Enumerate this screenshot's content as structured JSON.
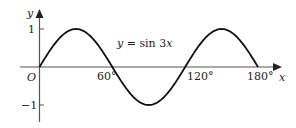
{
  "chart_data": {
    "type": "line",
    "title": "",
    "curve_label": "y = sin 3x",
    "function": "sin(3x)",
    "xlabel": "x",
    "ylabel": "y",
    "origin_label": "O",
    "x_unit": "degrees",
    "xlim": [
      0,
      180
    ],
    "ylim": [
      -1,
      1
    ],
    "x_ticks": [
      60,
      120,
      180
    ],
    "x_tick_labels": [
      "60°",
      "120°",
      "180°"
    ],
    "y_ticks": [
      1,
      -1
    ],
    "y_tick_labels": [
      "1",
      "−1"
    ],
    "grid": false,
    "legend": "none",
    "x": [
      0,
      15,
      30,
      45,
      60,
      75,
      90,
      105,
      120,
      135,
      150,
      165,
      180
    ],
    "values": [
      0,
      0.707,
      1,
      0.707,
      0,
      -0.707,
      -1,
      -0.707,
      0,
      0.707,
      1,
      0.707,
      0
    ]
  },
  "labels": {
    "y_axis": "y",
    "x_axis": "x",
    "origin": "O",
    "tick_1": "1",
    "tick_m1": "−1",
    "tick_60": "60°",
    "tick_120": "120°",
    "tick_180": "180°",
    "curve_eq_prefix": "y",
    "curve_eq_rest": " = sin 3",
    "curve_eq_var": "x"
  }
}
